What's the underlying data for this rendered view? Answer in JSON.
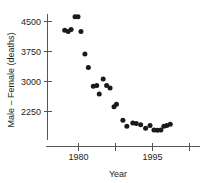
{
  "chart_data": {
    "type": "scatter",
    "title": "",
    "xlabel": "Year",
    "ylabel": "Male – Female (deaths)",
    "xlim": [
      1976.5,
      1999.5
    ],
    "ylim": [
      1700,
      4800
    ],
    "grid": false,
    "legend": null,
    "marker": "filled-circle",
    "marker_color": "#1a1a1a",
    "xticks": [
      1980,
      1987.5,
      1995,
      2002.5
    ],
    "xtick_labels": [
      "1980",
      "",
      "1995",
      ""
    ],
    "yticks": [
      2250,
      3000,
      3750,
      4500
    ],
    "ytick_labels": [
      "2250",
      "3000",
      "3750",
      "4500"
    ],
    "points": [
      {
        "x": 1977.2,
        "y": 4280
      },
      {
        "x": 1977.9,
        "y": 4250
      },
      {
        "x": 1978.5,
        "y": 4300
      },
      {
        "x": 1979.3,
        "y": 4620
      },
      {
        "x": 1979.9,
        "y": 4620
      },
      {
        "x": 1980.5,
        "y": 4250
      },
      {
        "x": 1981.3,
        "y": 3690
      },
      {
        "x": 1982.0,
        "y": 3350
      },
      {
        "x": 1983.0,
        "y": 2880
      },
      {
        "x": 1983.7,
        "y": 2900
      },
      {
        "x": 1984.2,
        "y": 2690
      },
      {
        "x": 1985.0,
        "y": 3060
      },
      {
        "x": 1985.7,
        "y": 2900
      },
      {
        "x": 1986.4,
        "y": 2840
      },
      {
        "x": 1987.2,
        "y": 2370
      },
      {
        "x": 1987.7,
        "y": 2430
      },
      {
        "x": 1989.0,
        "y": 2030
      },
      {
        "x": 1989.8,
        "y": 1880
      },
      {
        "x": 1991.0,
        "y": 1960
      },
      {
        "x": 1991.7,
        "y": 1950
      },
      {
        "x": 1992.6,
        "y": 1920
      },
      {
        "x": 1993.6,
        "y": 1830
      },
      {
        "x": 1994.5,
        "y": 1900
      },
      {
        "x": 1995.3,
        "y": 1790
      },
      {
        "x": 1996.0,
        "y": 1780
      },
      {
        "x": 1996.7,
        "y": 1790
      },
      {
        "x": 1997.3,
        "y": 1880
      },
      {
        "x": 1997.9,
        "y": 1900
      },
      {
        "x": 1998.6,
        "y": 1930
      }
    ]
  },
  "axes": {
    "y_axis_title": "Male – Female (deaths)",
    "x_axis_title": "Year",
    "y_labels": [
      "4500",
      "3750",
      "3000",
      "2250"
    ],
    "x_labels": [
      "1980",
      "1995"
    ]
  },
  "colors": {
    "marker": "#1a1a1a",
    "axis": "#555555",
    "text": "#1d1d1d",
    "background": "#ffffff"
  }
}
